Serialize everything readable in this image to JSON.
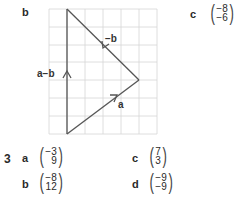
{
  "part_b": {
    "label": "b",
    "diagram": {
      "grid": {
        "x0": 49,
        "y0": 9,
        "cols": 6,
        "rows": 7,
        "cell_w": 18,
        "cell_h": 17.86,
        "color": "#d6d6d6"
      },
      "vertices": {
        "top": [
          67,
          9
        ],
        "right": [
          139,
          80
        ],
        "bottom": [
          67,
          134
        ]
      },
      "line_color": "#555555",
      "vectors": [
        {
          "name": "a",
          "label": "a",
          "from": "bottom",
          "to": "right"
        },
        {
          "name": "-b",
          "label": "−b",
          "from": "right",
          "to": "top"
        },
        {
          "name": "a-b",
          "label": "a−b",
          "from": "bottom",
          "to": "top"
        }
      ]
    }
  },
  "part_c": {
    "label": "c",
    "vector": {
      "top": "−8",
      "bottom": "−6"
    }
  },
  "question3": {
    "number": "3",
    "items": [
      {
        "label": "a",
        "top": "−3",
        "bottom": "9"
      },
      {
        "label": "b",
        "top": "−8",
        "bottom": "12"
      },
      {
        "label": "c",
        "top": "7",
        "bottom": "3"
      },
      {
        "label": "d",
        "top": "−9",
        "bottom": "−9"
      }
    ]
  }
}
